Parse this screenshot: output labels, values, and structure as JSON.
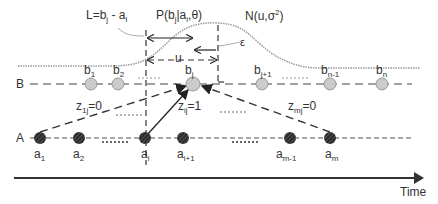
{
  "diagram": {
    "annotations": {
      "lag_def": {
        "text": "L=b",
        "sub": "j",
        "rest": " - a",
        "sub2": "i"
      },
      "prob": {
        "text": "P(b",
        "sub": "j",
        "mid": "|a",
        "sub2": "i",
        "rest": ",θ)"
      },
      "normal": {
        "text": "N(u,σ",
        "sup": "2",
        "rest": ")"
      },
      "epsilon": "ε",
      "u": "u"
    },
    "rows": {
      "B": {
        "label": "B",
        "nodes": [
          {
            "base": "b",
            "sub": "1"
          },
          {
            "base": "b",
            "sub": "2"
          },
          {
            "base": "b",
            "sub": "j"
          },
          {
            "base": "b",
            "sub": "j+1"
          },
          {
            "base": "b",
            "sub": "n-1"
          },
          {
            "base": "b",
            "sub": "n"
          }
        ]
      },
      "A": {
        "label": "A",
        "nodes": [
          {
            "base": "a",
            "sub": "1"
          },
          {
            "base": "a",
            "sub": "2"
          },
          {
            "base": "a",
            "sub": "i"
          },
          {
            "base": "a",
            "sub": "i+1"
          },
          {
            "base": "a",
            "sub": "m-1"
          },
          {
            "base": "a",
            "sub": "m"
          }
        ]
      }
    },
    "edges": [
      {
        "from": "a1",
        "to": "bj",
        "label": "z",
        "sub": "1j",
        "value": "=0",
        "style": "dashed"
      },
      {
        "from": "ai",
        "to": "bj",
        "label": "z",
        "sub": "ij",
        "value": "=1",
        "style": "solid"
      },
      {
        "from": "am",
        "to": "bj",
        "label": "z",
        "sub": "mj",
        "value": "=0",
        "style": "dashed"
      }
    ],
    "axis": {
      "label": "Time"
    },
    "colors": {
      "b_node": "#c8c8c8",
      "a_node": "#2a2a2a",
      "curve": "#9a9a9a",
      "line": "#444444"
    }
  }
}
